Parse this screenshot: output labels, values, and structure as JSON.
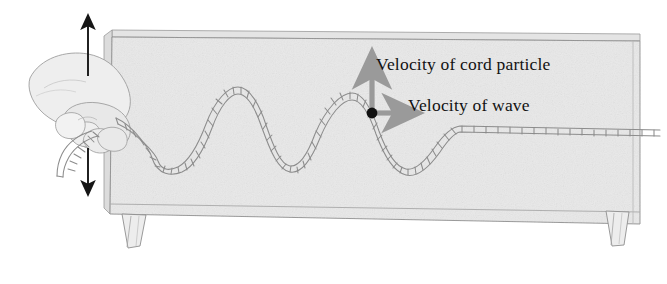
{
  "figure": {
    "type": "physics-diagram"
  },
  "annotations": {
    "cord_particle_velocity_label": "Velocity of cord particle",
    "wave_velocity_label": "Velocity of wave"
  },
  "elements": {
    "hand_label": "hand gripping cord",
    "table_label": "table",
    "cord_label": "cord",
    "particle_label": "cord particle",
    "shake_up_label": "shake up",
    "shake_down_label": "shake down"
  },
  "colors": {
    "background": "#ffffff",
    "table_fill": "#e9e9e9",
    "table_edge": "#8a8a8a",
    "cord_stroke": "#8c8c8c",
    "arrow_gray": "#9a9a9a",
    "arrow_black": "#161616",
    "particle_dot": "#111111",
    "text": "#121212"
  }
}
